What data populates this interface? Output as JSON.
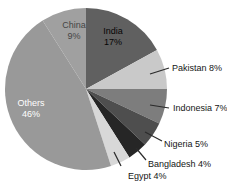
{
  "chart_data": {
    "type": "pie",
    "title": "",
    "unit": "%",
    "start_angle_deg": 0,
    "direction": "clockwise",
    "background": "#ffffff",
    "leader_line_color": "#2b2b2b",
    "slices": [
      {
        "label": "India",
        "value": 17,
        "color": "#606060",
        "text_color": "#050505",
        "label_placement": "inside",
        "label_x": 113,
        "label_y": 34
      },
      {
        "label": "Pakistan",
        "value": 8,
        "color": "#c9c9c9",
        "text_color": "#151515",
        "label_placement": "outside",
        "label_x": 172,
        "label_y": 71,
        "leader": [
          150,
          74,
          169,
          68
        ]
      },
      {
        "label": "Indonesia",
        "value": 7,
        "color": "#7d7d7d",
        "text_color": "#151515",
        "label_placement": "outside",
        "label_x": 173,
        "label_y": 111,
        "leader": [
          150,
          105,
          169,
          108
        ]
      },
      {
        "label": "Nigeria",
        "value": 5,
        "color": "#4e4e4e",
        "text_color": "#151515",
        "label_placement": "outside",
        "label_x": 164,
        "label_y": 147,
        "leader": [
          145,
          132,
          162,
          141
        ]
      },
      {
        "label": "Bangladesh",
        "value": 4,
        "color": "#262626",
        "text_color": "#151515",
        "label_placement": "outside",
        "label_x": 148,
        "label_y": 167,
        "leader": [
          136,
          148,
          146,
          160
        ]
      },
      {
        "label": "Egypt",
        "value": 4,
        "color": "#d8d8d8",
        "text_color": "#151515",
        "label_placement": "outside",
        "label_x": 128,
        "label_y": 179,
        "leader": [
          114,
          152,
          121,
          166
        ]
      },
      {
        "label": "Others",
        "value": 46,
        "color": "#999999",
        "text_color": "#ffffff",
        "label_placement": "inside",
        "label_x": 31,
        "label_y": 106
      },
      {
        "label": "China",
        "value": 9,
        "color": "#a0a0a0",
        "text_color": "#454545",
        "label_placement": "inside",
        "label_x": 74,
        "label_y": 28
      }
    ],
    "geometry_hint": {
      "cx": 86,
      "cy": 89,
      "r": 81,
      "width": 227,
      "height": 183,
      "inside_label_line_gap": 11
    }
  }
}
